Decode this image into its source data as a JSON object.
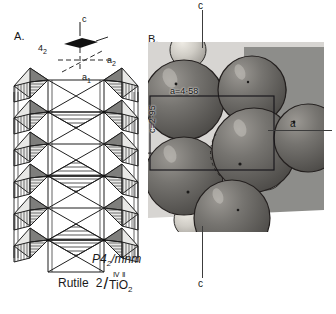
{
  "figure": {
    "panels": [
      {
        "id": "A",
        "label": "A.",
        "caption": "chain of edge-sharing TiO6 octahedra"
      },
      {
        "id": "B",
        "label": "B.",
        "caption": "space-filling sphere model photograph"
      }
    ]
  },
  "panelA": {
    "label": "A.",
    "axes": {
      "c_label": "c",
      "a1_label": "a",
      "a1_sub": "1",
      "a2_label": "a",
      "a2_sub": "2",
      "symmetry_label": "4",
      "symmetry_sub": "2",
      "symmetry_icon": "four-two-screw-axis-lens-icon"
    }
  },
  "panelB": {
    "label": "B.",
    "axis_top_label": "c",
    "axis_bottom_label": "c",
    "axis_right_label": "a",
    "a_dimension": "a=4·58",
    "c_dimension": "c=2·95"
  },
  "caption": {
    "space_group": "P4",
    "space_group_sub": "2",
    "space_group_rest": "/mnm",
    "mineral": "Rutile",
    "formula_numerator": "2",
    "formula_roman": "ⅣⅡ",
    "formula_denominator": "TiO",
    "formula_den_sub": "2"
  },
  "colors": {
    "oxygen_sphere": "#6e6c69",
    "titanium_sphere": "#cdcac3",
    "photo_bg_light": "#d7d5d2",
    "photo_bg_dark": "#8d8d8a",
    "axis_line": "#3c3c3c",
    "ink": "#1a1a1a"
  }
}
